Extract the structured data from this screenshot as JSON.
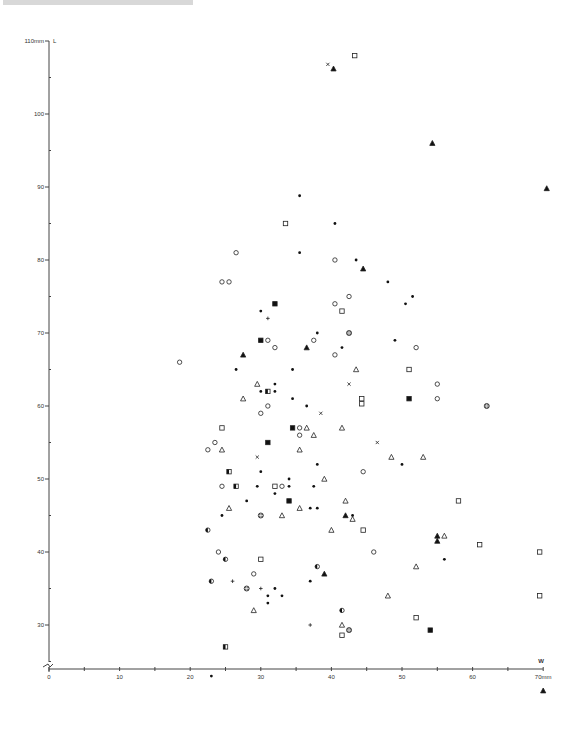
{
  "chart_data": {
    "type": "scatter",
    "title": "",
    "xlabel": "W",
    "ylabel": "L",
    "x_unit": "mm",
    "y_unit": "mm",
    "xlim": [
      0,
      70
    ],
    "ylim": [
      20,
      110
    ],
    "x_ticks": [
      0,
      10,
      20,
      30,
      40,
      50,
      60,
      70
    ],
    "x_tick_labels": [
      "0",
      "10",
      "20",
      "30",
      "40",
      "50",
      "60",
      "70mm"
    ],
    "y_ticks": [
      30,
      40,
      50,
      60,
      70,
      80,
      90,
      100,
      110
    ],
    "y_tick_labels": [
      "30",
      "40",
      "50",
      "60",
      "70",
      "80",
      "90",
      "100",
      "110mm"
    ],
    "y_axis_break": true,
    "grid": false,
    "legend": "none",
    "marker_types": [
      "dot",
      "open-circle",
      "open-square",
      "filled-square",
      "open-triangle",
      "filled-triangle",
      "cross",
      "plus",
      "half-circle",
      "circle-plus",
      "half-square"
    ],
    "points": [
      {
        "x": 39.5,
        "y": 106.8,
        "m": "cross"
      },
      {
        "x": 40.3,
        "y": 106.2,
        "m": "filled-triangle"
      },
      {
        "x": 43.3,
        "y": 108.0,
        "m": "open-square"
      },
      {
        "x": 54.3,
        "y": 96.0,
        "m": "filled-triangle"
      },
      {
        "x": 70.5,
        "y": 89.8,
        "m": "filled-triangle"
      },
      {
        "x": 35.5,
        "y": 88.8,
        "m": "dot"
      },
      {
        "x": 40.5,
        "y": 85.0,
        "m": "dot"
      },
      {
        "x": 33.5,
        "y": 85.0,
        "m": "open-square"
      },
      {
        "x": 35.5,
        "y": 81.0,
        "m": "dot"
      },
      {
        "x": 26.5,
        "y": 81.0,
        "m": "open-circle"
      },
      {
        "x": 40.5,
        "y": 80.0,
        "m": "open-circle"
      },
      {
        "x": 24.5,
        "y": 77.0,
        "m": "open-circle"
      },
      {
        "x": 25.5,
        "y": 77.0,
        "m": "open-circle"
      },
      {
        "x": 43.5,
        "y": 80.0,
        "m": "dot"
      },
      {
        "x": 44.5,
        "y": 78.8,
        "m": "filled-triangle"
      },
      {
        "x": 48.0,
        "y": 77.0,
        "m": "dot"
      },
      {
        "x": 51.5,
        "y": 75.0,
        "m": "dot"
      },
      {
        "x": 50.5,
        "y": 74.0,
        "m": "dot"
      },
      {
        "x": 42.5,
        "y": 75.0,
        "m": "open-circle"
      },
      {
        "x": 40.5,
        "y": 74.0,
        "m": "open-circle"
      },
      {
        "x": 41.5,
        "y": 73.0,
        "m": "open-square"
      },
      {
        "x": 32.0,
        "y": 74.0,
        "m": "filled-square"
      },
      {
        "x": 30.0,
        "y": 73.0,
        "m": "dot"
      },
      {
        "x": 31.0,
        "y": 72.0,
        "m": "plus"
      },
      {
        "x": 42.5,
        "y": 70.0,
        "m": "circle-plus"
      },
      {
        "x": 38.0,
        "y": 70.0,
        "m": "dot"
      },
      {
        "x": 30.0,
        "y": 69.0,
        "m": "filled-square"
      },
      {
        "x": 31.0,
        "y": 69.0,
        "m": "open-circle"
      },
      {
        "x": 32.0,
        "y": 68.0,
        "m": "open-circle"
      },
      {
        "x": 37.5,
        "y": 69.0,
        "m": "open-circle"
      },
      {
        "x": 36.5,
        "y": 68.0,
        "m": "filled-triangle"
      },
      {
        "x": 41.5,
        "y": 68.0,
        "m": "dot"
      },
      {
        "x": 49.0,
        "y": 69.0,
        "m": "dot"
      },
      {
        "x": 52.0,
        "y": 68.0,
        "m": "open-circle"
      },
      {
        "x": 27.5,
        "y": 67.0,
        "m": "filled-triangle"
      },
      {
        "x": 40.5,
        "y": 67.0,
        "m": "open-circle"
      },
      {
        "x": 18.5,
        "y": 66.0,
        "m": "open-circle"
      },
      {
        "x": 26.5,
        "y": 65.0,
        "m": "dot"
      },
      {
        "x": 34.5,
        "y": 65.0,
        "m": "dot"
      },
      {
        "x": 43.5,
        "y": 65.0,
        "m": "open-triangle"
      },
      {
        "x": 51.0,
        "y": 65.0,
        "m": "open-square"
      },
      {
        "x": 29.5,
        "y": 63.0,
        "m": "open-triangle"
      },
      {
        "x": 32.0,
        "y": 63.0,
        "m": "dot"
      },
      {
        "x": 42.5,
        "y": 63.0,
        "m": "cross"
      },
      {
        "x": 55.0,
        "y": 63.0,
        "m": "open-circle"
      },
      {
        "x": 30.0,
        "y": 62.0,
        "m": "dot"
      },
      {
        "x": 31.0,
        "y": 62.0,
        "m": "half-square"
      },
      {
        "x": 32.0,
        "y": 62.0,
        "m": "dot"
      },
      {
        "x": 27.5,
        "y": 61.0,
        "m": "open-triangle"
      },
      {
        "x": 34.5,
        "y": 61.0,
        "m": "dot"
      },
      {
        "x": 36.5,
        "y": 60.0,
        "m": "dot"
      },
      {
        "x": 31.0,
        "y": 60.0,
        "m": "open-circle"
      },
      {
        "x": 30.0,
        "y": 59.0,
        "m": "open-circle"
      },
      {
        "x": 38.5,
        "y": 59.0,
        "m": "cross"
      },
      {
        "x": 44.3,
        "y": 61.0,
        "m": "open-square"
      },
      {
        "x": 44.3,
        "y": 60.3,
        "m": "open-square"
      },
      {
        "x": 51.0,
        "y": 61.0,
        "m": "filled-square"
      },
      {
        "x": 55.0,
        "y": 61.0,
        "m": "open-circle"
      },
      {
        "x": 62.0,
        "y": 60.0,
        "m": "circle-plus"
      },
      {
        "x": 24.5,
        "y": 57.0,
        "m": "open-square"
      },
      {
        "x": 34.5,
        "y": 57.0,
        "m": "filled-square"
      },
      {
        "x": 35.5,
        "y": 57.0,
        "m": "open-circle"
      },
      {
        "x": 36.5,
        "y": 57.0,
        "m": "open-triangle"
      },
      {
        "x": 35.5,
        "y": 56.0,
        "m": "open-circle"
      },
      {
        "x": 37.5,
        "y": 56.0,
        "m": "open-triangle"
      },
      {
        "x": 41.5,
        "y": 57.0,
        "m": "open-triangle"
      },
      {
        "x": 31.0,
        "y": 55.0,
        "m": "filled-square"
      },
      {
        "x": 23.5,
        "y": 55.0,
        "m": "open-circle"
      },
      {
        "x": 22.5,
        "y": 54.0,
        "m": "open-circle"
      },
      {
        "x": 24.5,
        "y": 54.0,
        "m": "open-triangle"
      },
      {
        "x": 35.5,
        "y": 54.0,
        "m": "open-triangle"
      },
      {
        "x": 46.5,
        "y": 55.0,
        "m": "cross"
      },
      {
        "x": 29.5,
        "y": 53.0,
        "m": "cross"
      },
      {
        "x": 48.5,
        "y": 53.0,
        "m": "open-triangle"
      },
      {
        "x": 53.0,
        "y": 53.0,
        "m": "open-triangle"
      },
      {
        "x": 38.0,
        "y": 52.0,
        "m": "dot"
      },
      {
        "x": 50.0,
        "y": 52.0,
        "m": "dot"
      },
      {
        "x": 25.5,
        "y": 51.0,
        "m": "half-square"
      },
      {
        "x": 30.0,
        "y": 51.0,
        "m": "dot"
      },
      {
        "x": 44.5,
        "y": 51.0,
        "m": "open-circle"
      },
      {
        "x": 24.5,
        "y": 49.0,
        "m": "open-circle"
      },
      {
        "x": 26.5,
        "y": 49.0,
        "m": "half-square"
      },
      {
        "x": 29.5,
        "y": 49.0,
        "m": "dot"
      },
      {
        "x": 32.0,
        "y": 49.0,
        "m": "open-square"
      },
      {
        "x": 33.0,
        "y": 49.0,
        "m": "open-circle"
      },
      {
        "x": 34.0,
        "y": 49.0,
        "m": "dot"
      },
      {
        "x": 34.0,
        "y": 50.0,
        "m": "dot"
      },
      {
        "x": 37.5,
        "y": 49.0,
        "m": "dot"
      },
      {
        "x": 39.0,
        "y": 50.0,
        "m": "open-triangle"
      },
      {
        "x": 32.0,
        "y": 48.0,
        "m": "dot"
      },
      {
        "x": 28.0,
        "y": 47.0,
        "m": "dot"
      },
      {
        "x": 34.0,
        "y": 47.0,
        "m": "filled-square"
      },
      {
        "x": 58.0,
        "y": 47.0,
        "m": "open-square"
      },
      {
        "x": 42.0,
        "y": 47.0,
        "m": "open-triangle"
      },
      {
        "x": 25.5,
        "y": 46.0,
        "m": "open-triangle"
      },
      {
        "x": 35.5,
        "y": 46.0,
        "m": "open-triangle"
      },
      {
        "x": 37.0,
        "y": 46.0,
        "m": "dot"
      },
      {
        "x": 38.0,
        "y": 46.0,
        "m": "dot"
      },
      {
        "x": 24.5,
        "y": 45.0,
        "m": "dot"
      },
      {
        "x": 30.0,
        "y": 45.0,
        "m": "circle-plus"
      },
      {
        "x": 33.0,
        "y": 45.0,
        "m": "open-triangle"
      },
      {
        "x": 42.0,
        "y": 45.0,
        "m": "filled-triangle"
      },
      {
        "x": 43.0,
        "y": 45.0,
        "m": "dot"
      },
      {
        "x": 43.0,
        "y": 44.5,
        "m": "open-triangle"
      },
      {
        "x": 40.0,
        "y": 43.0,
        "m": "open-triangle"
      },
      {
        "x": 44.5,
        "y": 43.0,
        "m": "open-square"
      },
      {
        "x": 22.5,
        "y": 43.0,
        "m": "half-circle"
      },
      {
        "x": 55.0,
        "y": 42.2,
        "m": "filled-triangle"
      },
      {
        "x": 56.0,
        "y": 42.2,
        "m": "open-triangle"
      },
      {
        "x": 55.0,
        "y": 41.5,
        "m": "filled-triangle"
      },
      {
        "x": 61.0,
        "y": 41.0,
        "m": "open-square"
      },
      {
        "x": 46.0,
        "y": 40.0,
        "m": "open-circle"
      },
      {
        "x": 69.5,
        "y": 40.0,
        "m": "open-square"
      },
      {
        "x": 24.0,
        "y": 40.0,
        "m": "open-circle"
      },
      {
        "x": 25.0,
        "y": 39.0,
        "m": "half-circle"
      },
      {
        "x": 30.0,
        "y": 39.0,
        "m": "open-square"
      },
      {
        "x": 56.0,
        "y": 39.0,
        "m": "dot"
      },
      {
        "x": 38.0,
        "y": 38.0,
        "m": "half-circle"
      },
      {
        "x": 52.0,
        "y": 38.0,
        "m": "open-triangle"
      },
      {
        "x": 29.0,
        "y": 37.0,
        "m": "open-circle"
      },
      {
        "x": 39.0,
        "y": 37.0,
        "m": "filled-triangle"
      },
      {
        "x": 23.0,
        "y": 36.0,
        "m": "half-circle"
      },
      {
        "x": 26.0,
        "y": 36.0,
        "m": "plus"
      },
      {
        "x": 37.0,
        "y": 36.0,
        "m": "dot"
      },
      {
        "x": 28.0,
        "y": 35.0,
        "m": "circle-plus"
      },
      {
        "x": 30.0,
        "y": 35.0,
        "m": "plus"
      },
      {
        "x": 32.0,
        "y": 35.0,
        "m": "dot"
      },
      {
        "x": 31.0,
        "y": 34.0,
        "m": "dot"
      },
      {
        "x": 33.0,
        "y": 34.0,
        "m": "dot"
      },
      {
        "x": 48.0,
        "y": 34.0,
        "m": "open-triangle"
      },
      {
        "x": 69.5,
        "y": 34.0,
        "m": "open-square"
      },
      {
        "x": 31.0,
        "y": 33.0,
        "m": "dot"
      },
      {
        "x": 29.0,
        "y": 32.0,
        "m": "open-triangle"
      },
      {
        "x": 41.5,
        "y": 32.0,
        "m": "half-circle"
      },
      {
        "x": 52.0,
        "y": 31.0,
        "m": "open-square"
      },
      {
        "x": 37.0,
        "y": 30.0,
        "m": "plus"
      },
      {
        "x": 41.5,
        "y": 30.0,
        "m": "open-triangle"
      },
      {
        "x": 42.5,
        "y": 29.3,
        "m": "circle-plus"
      },
      {
        "x": 41.5,
        "y": 28.6,
        "m": "open-square"
      },
      {
        "x": 54.0,
        "y": 29.3,
        "m": "filled-square"
      },
      {
        "x": 25.0,
        "y": 27.0,
        "m": "half-square"
      },
      {
        "x": 23.0,
        "y": 23.0,
        "m": "dot"
      },
      {
        "x": 70.0,
        "y": 21.0,
        "m": "filled-triangle"
      }
    ]
  },
  "axes": {
    "y_label_top": "110mm",
    "y_axis_letter": "L",
    "x_axis_letter": "W",
    "x_end_label": "70mm"
  }
}
